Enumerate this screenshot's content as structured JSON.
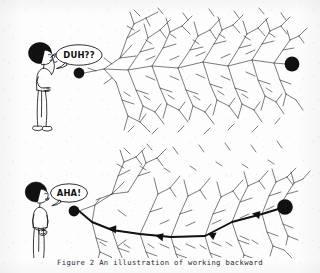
{
  "figure": {
    "caption": "Figure  2   An illustration of working backward",
    "caption_label": "Figure",
    "caption_number": "2",
    "caption_text": "An illustration of working backward",
    "ink_color": "#1a1a1a",
    "paper_color": "#fdfdfd",
    "width": 320,
    "height": 273
  },
  "panels": [
    {
      "id": "top",
      "name": "forward-search-panel",
      "speech": "DUH??",
      "person_pose": "scratching-head-confused",
      "path_highlighted": false,
      "start_node_label": "start",
      "goal_node_label": "goal",
      "description": "Exhaustive search tree with no solution path found"
    },
    {
      "id": "bottom",
      "name": "backward-search-panel",
      "speech": "AHA!",
      "person_pose": "standing-hands-together-insight",
      "path_highlighted": true,
      "start_node_label": "start",
      "goal_node_label": "goal",
      "description": "Same search tree with bold solution path traced backward from goal to start"
    }
  ],
  "nodes": {
    "start_top": {
      "name": "start-node",
      "cx": 79,
      "cy": 73,
      "r": 5.4
    },
    "goal_top": {
      "name": "goal-node",
      "cx": 292,
      "cy": 64,
      "r": 7.4
    },
    "start_bottom": {
      "name": "start-node",
      "cx": 74,
      "cy": 211,
      "r": 5.4
    },
    "goal_bottom": {
      "name": "goal-node",
      "cx": 285,
      "cy": 207,
      "r": 7.8
    }
  },
  "solution_path": {
    "name": "working-backward-path",
    "stroke_width": 1.9,
    "arrow_count": 4,
    "direction": "goal-to-start",
    "points": "285,207 262,214 232,222 205,236 171,237 140,234 112,230 92,222 74,211"
  }
}
